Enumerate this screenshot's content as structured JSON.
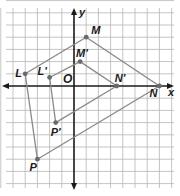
{
  "diagram": {
    "type": "coordinate-plane-dilation",
    "axes": {
      "x_label": "x",
      "y_label": "y",
      "origin_label": "O"
    },
    "grid": {
      "unit_px": 12.2,
      "origin_px": [
        74,
        86
      ],
      "x_range": [
        -6,
        8
      ],
      "y_range": [
        -8,
        7
      ],
      "line_color": "#b5b5b5",
      "axis_color": "#1a1a1a"
    },
    "polygons": [
      {
        "name": "original",
        "color": "#8a8a8a",
        "vertices": [
          {
            "label": "L",
            "x": -4,
            "y": 1
          },
          {
            "label": "M",
            "x": 1,
            "y": 4
          },
          {
            "label": "N",
            "x": 7,
            "y": 0
          },
          {
            "label": "P",
            "x": -3,
            "y": -6
          }
        ]
      },
      {
        "name": "image",
        "color": "#8a8a8a",
        "vertices": [
          {
            "label": "L'",
            "x": -2,
            "y": 0.7
          },
          {
            "label": "M'",
            "x": 0.5,
            "y": 2
          },
          {
            "label": "N'",
            "x": 3.5,
            "y": 0
          },
          {
            "label": "P'",
            "x": -1.5,
            "y": -3
          }
        ]
      }
    ],
    "point_color": "#6a6a6a"
  }
}
